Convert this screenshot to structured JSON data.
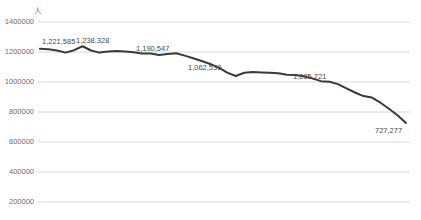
{
  "chart_data": {
    "type": "line",
    "title": "",
    "xlabel": "",
    "ylabel": "人",
    "ylim": [
      200000,
      1400000
    ],
    "ytick_labels": [
      "1400000",
      "1200000",
      "1000000",
      "800000",
      "600000",
      "400000",
      "200000"
    ],
    "ytick_values": [
      1400000,
      1200000,
      1000000,
      800000,
      600000,
      400000,
      200000
    ],
    "grid": true,
    "legend": "none",
    "line_color": "#3a3a3a",
    "grid_color": "#d8d8d8",
    "annotations": [
      {
        "label": "1,221,585",
        "value": 1221585,
        "index": 0
      },
      {
        "label": "1,238,328",
        "value": 1238328,
        "index": 5
      },
      {
        "label": "1,190,547",
        "value": 1190547,
        "index": 13
      },
      {
        "label": "1,062,530",
        "value": 1062530,
        "index": 22
      },
      {
        "label": "1,005,721",
        "value": 1005721,
        "index": 33
      },
      {
        "label": "727,277",
        "value": 727277,
        "index": 43
      }
    ],
    "values": [
      1221585,
      1218000,
      1210000,
      1196000,
      1212000,
      1238328,
      1210000,
      1196000,
      1204000,
      1207000,
      1204000,
      1198000,
      1190000,
      1190547,
      1180000,
      1186000,
      1192000,
      1176000,
      1158000,
      1140000,
      1120000,
      1096000,
      1062530,
      1040000,
      1062000,
      1066000,
      1064000,
      1062000,
      1058000,
      1048000,
      1046000,
      1038000,
      1024000,
      1005721,
      1002000,
      986000,
      958000,
      930000,
      906000,
      896000,
      862000,
      822000,
      778000,
      727277
    ]
  }
}
